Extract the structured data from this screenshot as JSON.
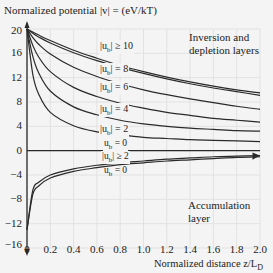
{
  "chart_data": {
    "type": "line",
    "title": "",
    "ylabel": "Normalized potential |v| = (eV/kT)",
    "xlabel": "Normalized distance z/L_D",
    "xlim": [
      0,
      2.0
    ],
    "ylim": [
      -16,
      20
    ],
    "grid": true,
    "x_ticks": [
      "0",
      "0.2",
      "0.4",
      "0.6",
      "0.8",
      "1.0",
      "1.2",
      "1.4",
      "1.6",
      "1.8",
      "2.0"
    ],
    "y_ticks": [
      "20",
      "16",
      "12",
      "8",
      "4",
      "0",
      "−4",
      "−8",
      "−12",
      "−16"
    ],
    "annotations": [
      "Inversion and depletion layers",
      "Accumulation layer"
    ],
    "x": [
      0,
      0.05,
      0.1,
      0.2,
      0.4,
      0.6,
      0.8,
      1.0,
      1.2,
      1.4,
      1.6,
      1.8,
      2.0
    ],
    "series": [
      {
        "name": "|u_b| ≥ 10 (a)",
        "values": [
          20,
          19.5,
          19.0,
          18.1,
          16.5,
          15.2,
          14.0,
          13.0,
          12.1,
          11.3,
          10.6,
          10.0,
          9.5
        ]
      },
      {
        "name": "|u_b| ≥ 10 (b)",
        "values": [
          20,
          19.3,
          18.7,
          17.7,
          16.1,
          14.8,
          13.7,
          12.7,
          11.8,
          11.0,
          10.3,
          9.7,
          9.1
        ]
      },
      {
        "name": "|u_b| = 8",
        "values": [
          20,
          18.6,
          17.5,
          15.9,
          13.7,
          12.2,
          11.0,
          10.0,
          9.2,
          8.5,
          7.9,
          7.3,
          6.8
        ]
      },
      {
        "name": "|u_b| = 6",
        "values": [
          20,
          17.3,
          15.4,
          13.0,
          10.4,
          8.9,
          7.8,
          7.0,
          6.3,
          5.8,
          5.3,
          5.0,
          4.7
        ]
      },
      {
        "name": "|u_b| = 4",
        "values": [
          20,
          15.5,
          12.8,
          9.8,
          7.2,
          5.9,
          5.0,
          4.4,
          4.0,
          3.7,
          3.5,
          3.3,
          3.2
        ]
      },
      {
        "name": "|u_b| = 2",
        "values": [
          20,
          12.5,
          9.3,
          6.3,
          4.1,
          3.1,
          2.6,
          2.2,
          2.0,
          1.8,
          1.7,
          1.6,
          1.5
        ]
      },
      {
        "name": "u_b = 0 (inversion)",
        "values": [
          0,
          0,
          0,
          0,
          0,
          0,
          0,
          0,
          0,
          0,
          0,
          0,
          0
        ]
      },
      {
        "name": "|u_b| ≥ 2 (accumulation)",
        "values": [
          -13,
          -6.5,
          -5.2,
          -4.0,
          -3.0,
          -2.4,
          -2.0,
          -1.7,
          -1.4,
          -1.2,
          -1.0,
          -0.9,
          -0.8
        ]
      },
      {
        "name": "u_b = 0 (accumulation)",
        "values": [
          -13,
          -7.2,
          -5.8,
          -4.5,
          -3.4,
          -2.8,
          -2.3,
          -2.0,
          -1.7,
          -1.5,
          -1.3,
          -1.1,
          -1.0
        ]
      }
    ]
  },
  "labels": {
    "y_axis_title": "Normalized potential  |v| = (eV/kT)",
    "x_axis_title": "Normalized distance z/L",
    "x_axis_sub": "D",
    "region_top_line1": "Inversion and",
    "region_top_line2": "depletion layers",
    "region_bottom_line1": "Accumulation",
    "region_bottom_line2": "layer",
    "curve_ub10": "|u",
    "curve_ub10_rel": "| ≥ 10",
    "curve_ub8_rel": "| = 8",
    "curve_ub6_rel": "| = 6",
    "curve_ub4_rel": "| = 4",
    "curve_ub2_rel": "| = 2",
    "curve_ub0_top": "u",
    "curve_ub0_rel": " = 0",
    "curve_acc_rel": "| ≥ 2",
    "sub_b": "b"
  },
  "colors": {
    "curve": "#2a2a2a",
    "grid": "#e2e2e2",
    "background": "#f4f4f4"
  }
}
